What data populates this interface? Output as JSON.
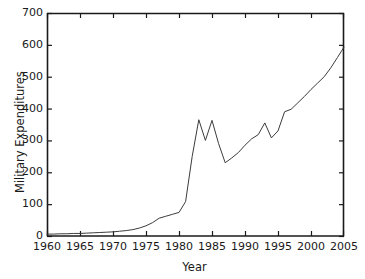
{
  "chart_data": {
    "type": "line",
    "title": "",
    "xlabel": "Year",
    "ylabel": "Military Expenditures",
    "xlim": [
      1960,
      2005
    ],
    "ylim": [
      0,
      700
    ],
    "xticks": [
      1960,
      1965,
      1970,
      1975,
      1980,
      1985,
      1990,
      1995,
      2000,
      2005
    ],
    "yticks": [
      0,
      100,
      200,
      300,
      400,
      500,
      600,
      700
    ],
    "xtick_labels": [
      "1960",
      "1965",
      "1970",
      "1975",
      "1980",
      "1985",
      "1990",
      "1995",
      "2000",
      "2005"
    ],
    "ytick_labels": [
      "0",
      "100",
      "200",
      "300",
      "400",
      "500",
      "600",
      "700"
    ],
    "grid": false,
    "legend": false,
    "legend_position": "none",
    "line_color": "#3c3c3c",
    "line_width": 1,
    "series": [
      {
        "name": "Military Expenditures",
        "x": [
          1960,
          1961,
          1962,
          1963,
          1964,
          1965,
          1966,
          1967,
          1968,
          1969,
          1970,
          1971,
          1972,
          1973,
          1974,
          1975,
          1976,
          1977,
          1978,
          1979,
          1980,
          1981,
          1982,
          1983,
          1984,
          1985,
          1986,
          1987,
          1988,
          1989,
          1990,
          1991,
          1992,
          1993,
          1994,
          1995,
          1996,
          1997,
          1998,
          1999,
          2000,
          2001,
          2002,
          2003,
          2004,
          2005
        ],
        "values": [
          6,
          6,
          7,
          7,
          8,
          8,
          9,
          10,
          11,
          12,
          13,
          15,
          17,
          20,
          25,
          32,
          42,
          56,
          62,
          68,
          74,
          108,
          250,
          365,
          300,
          363,
          290,
          230,
          245,
          262,
          285,
          305,
          318,
          355,
          308,
          330,
          390,
          398,
          418,
          438,
          460,
          480,
          500,
          528,
          560,
          593
        ]
      }
    ]
  },
  "axes": {
    "ylabel_text": "Military Expenditures",
    "xlabel_text": "Year"
  }
}
